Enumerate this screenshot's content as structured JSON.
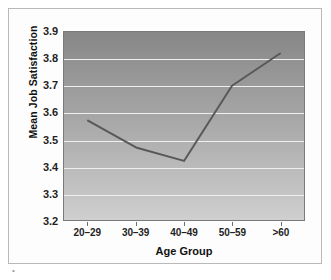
{
  "chart_data": {
    "type": "line",
    "title": "",
    "xlabel": "Age Group",
    "ylabel": "Mean Job Satisfaction",
    "categories": [
      "20–29",
      "30–39",
      "40–49",
      "50–59",
      ">60"
    ],
    "values": [
      3.57,
      3.47,
      3.42,
      3.7,
      3.82
    ],
    "ylim": [
      3.2,
      3.9
    ],
    "ytick_labels": [
      "3.9",
      "3.8",
      "3.7",
      "3.6",
      "3.5",
      "3.4",
      "3.3",
      "3.2"
    ],
    "ytick_values": [
      3.9,
      3.8,
      3.7,
      3.6,
      3.5,
      3.4,
      3.3,
      3.2
    ],
    "grid": true,
    "gridline_color": "#efefef",
    "legend": "none",
    "series": [
      {
        "name": "Mean Job Satisfaction",
        "values": [
          3.57,
          3.47,
          3.42,
          3.7,
          3.82
        ],
        "color": "#585858"
      }
    ],
    "plot_background": "gradient-gray-dark-top-to-light-bottom",
    "plot_bg_top_color": "#878787",
    "plot_bg_bottom_color": "#cfcfcf",
    "line_color": "#585858",
    "axis_color": "#7a7a7a",
    "text_color": "#1f1f1f"
  }
}
